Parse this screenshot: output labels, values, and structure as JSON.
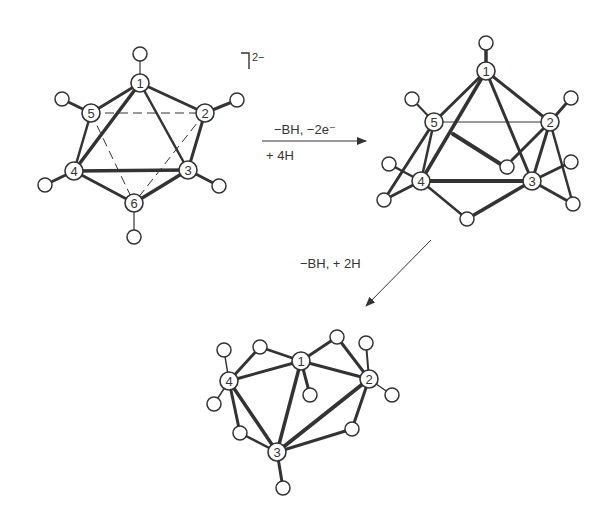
{
  "figure": {
    "colors": {
      "line": "#333333",
      "background": "#ffffff"
    }
  },
  "structures": [
    {
      "id": "closo_B6H6",
      "charge": "2−",
      "atoms": [
        {
          "n": "1",
          "x": 140,
          "y": 83
        },
        {
          "n": "2",
          "x": 205,
          "y": 113
        },
        {
          "n": "3",
          "x": 188,
          "y": 170
        },
        {
          "n": "4",
          "x": 74,
          "y": 171
        },
        {
          "n": "5",
          "x": 91,
          "y": 113
        },
        {
          "n": "6",
          "x": 134,
          "y": 203
        }
      ],
      "hydrogens": [
        {
          "x": 140,
          "y": 54,
          "to": "1"
        },
        {
          "x": 237,
          "y": 100,
          "to": "2"
        },
        {
          "x": 219,
          "y": 186,
          "to": "3"
        },
        {
          "x": 45,
          "y": 185,
          "to": "4"
        },
        {
          "x": 62,
          "y": 99,
          "to": "5"
        },
        {
          "x": 134,
          "y": 237,
          "to": "6"
        }
      ]
    },
    {
      "id": "nido_B5H9",
      "atoms": [
        {
          "n": "1",
          "x": 486,
          "y": 71
        },
        {
          "n": "2",
          "x": 550,
          "y": 122
        },
        {
          "n": "3",
          "x": 532,
          "y": 181
        },
        {
          "n": "4",
          "x": 421,
          "y": 181
        },
        {
          "n": "5",
          "x": 434,
          "y": 122
        }
      ]
    },
    {
      "id": "arachno_B4H10",
      "atoms": [
        {
          "n": "1",
          "x": 301,
          "y": 361
        },
        {
          "n": "2",
          "x": 369,
          "y": 379
        },
        {
          "n": "3",
          "x": 277,
          "y": 452
        },
        {
          "n": "4",
          "x": 229,
          "y": 381
        }
      ]
    }
  ],
  "reactions": [
    {
      "id": "step1",
      "above": "−BH, −2e⁻",
      "below": "+ 4H"
    },
    {
      "id": "step2",
      "label": "−BH, + 2H"
    }
  ]
}
